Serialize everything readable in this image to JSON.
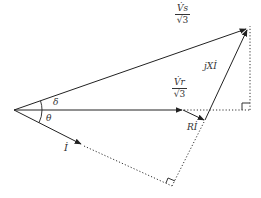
{
  "diagram": {
    "type": "phasor-diagram",
    "colors": {
      "line": "#222222",
      "text": "#333333",
      "background": "#ffffff"
    },
    "labels": {
      "vs": {
        "numerator": "V̇s",
        "denominator": "√3"
      },
      "vr": {
        "numerator": "V̇r",
        "denominator": "√3"
      },
      "jxi": "jXİ",
      "ri": "Rİ",
      "current": "İ",
      "delta": "δ",
      "theta": "θ"
    },
    "points": {
      "origin": [
        14,
        110
      ],
      "vs_tip": [
        248,
        28
      ],
      "vr_tip": [
        183,
        110
      ],
      "ri_tip": [
        205,
        120
      ],
      "i_tip": [
        82,
        145
      ],
      "i_proj": [
        172,
        185
      ],
      "horiz_proj": [
        250,
        110
      ]
    }
  }
}
